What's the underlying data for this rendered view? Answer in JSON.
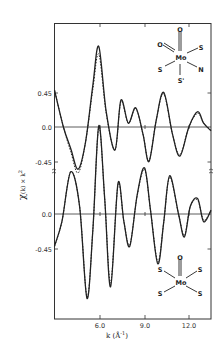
{
  "chart_data": {
    "type": "line",
    "title": "",
    "xlabel": "k (Å⁻¹)",
    "ylabel": "χ(k) × k²",
    "xlim": [
      2.9,
      13.5
    ],
    "x_ticks": [
      6.0,
      9.0,
      12.0
    ],
    "x_tick_labels": [
      "6.0",
      "9.0",
      "12.0"
    ],
    "grid": false,
    "legend": null,
    "panels": [
      {
        "name": "top",
        "structure_label": {
          "center": "Mo",
          "ligands": [
            "O",
            "O",
            "S",
            "S",
            "N",
            "S'"
          ]
        },
        "y_ticks": [
          0.45,
          0.0,
          -0.45
        ],
        "y_tick_labels": [
          "0.45",
          "0.0",
          "-0.45"
        ],
        "series": [
          {
            "name": "experimental",
            "style": "solid",
            "x": [
              2.9,
              3.5,
              4.0,
              4.5,
              5.0,
              5.5,
              5.9,
              6.4,
              7.0,
              7.4,
              7.9,
              8.4,
              8.9,
              9.3,
              9.8,
              10.3,
              10.9,
              11.4,
              12.0,
              12.6,
              13.0,
              13.5
            ],
            "y": [
              0.48,
              0.0,
              -0.28,
              -0.55,
              -0.2,
              0.55,
              1.05,
              0.2,
              -0.3,
              0.35,
              0.05,
              0.25,
              -0.1,
              -0.45,
              0.1,
              0.45,
              -0.1,
              -0.38,
              0.0,
              0.2,
              0.05,
              -0.05
            ]
          },
          {
            "name": "fit",
            "style": "dashed",
            "x": [
              2.9,
              3.5,
              4.0,
              4.5,
              5.0,
              5.5,
              5.9,
              6.4,
              7.0,
              7.4,
              7.9,
              8.4,
              8.9,
              9.3,
              9.8,
              10.3,
              10.9,
              11.4,
              12.0,
              12.6,
              13.0,
              13.5
            ],
            "y": [
              0.48,
              0.0,
              -0.32,
              -0.6,
              -0.2,
              0.5,
              0.95,
              0.18,
              -0.3,
              0.33,
              0.05,
              0.24,
              -0.1,
              -0.44,
              0.1,
              0.43,
              -0.1,
              -0.36,
              0.0,
              0.18,
              0.05,
              -0.04
            ]
          }
        ]
      },
      {
        "name": "bottom",
        "structure_label": {
          "center": "Mo",
          "ligands": [
            "O",
            "S",
            "S",
            "S",
            "S"
          ]
        },
        "y_ticks": [
          0.0,
          -0.45
        ],
        "y_tick_labels": [
          "0.0",
          "-0.45"
        ],
        "series": [
          {
            "name": "experimental",
            "style": "solid",
            "x": [
              2.9,
              3.4,
              4.0,
              4.6,
              5.1,
              5.5,
              5.9,
              6.3,
              6.7,
              7.2,
              7.6,
              8.0,
              8.5,
              9.0,
              9.4,
              9.9,
              10.3,
              10.7,
              11.3,
              11.7,
              12.1,
              12.6,
              13.0,
              13.5
            ],
            "y": [
              -0.42,
              -0.1,
              0.55,
              0.1,
              -1.1,
              -0.2,
              1.15,
              0.2,
              -0.95,
              0.4,
              -0.1,
              -0.42,
              0.25,
              0.6,
              0.05,
              -0.65,
              -0.1,
              0.5,
              0.0,
              -0.3,
              0.1,
              0.2,
              -0.1,
              0.05
            ]
          },
          {
            "name": "fit",
            "style": "dashed",
            "x": [
              2.9,
              3.4,
              4.0,
              4.6,
              5.1,
              5.5,
              5.9,
              6.3,
              6.7,
              7.2,
              7.6,
              8.0,
              8.5,
              9.0,
              9.4,
              9.9,
              10.3,
              10.7,
              11.3,
              11.7,
              12.1,
              12.6,
              13.0,
              13.5
            ],
            "y": [
              -0.42,
              -0.1,
              0.55,
              0.1,
              -1.08,
              -0.2,
              1.13,
              0.2,
              -0.9,
              0.38,
              -0.1,
              -0.4,
              0.24,
              0.58,
              0.05,
              -0.62,
              -0.1,
              0.48,
              0.0,
              -0.28,
              0.1,
              0.18,
              -0.08,
              0.04
            ]
          }
        ]
      }
    ]
  },
  "labels": {
    "top_y_0": "0.45",
    "top_y_1": "0.0",
    "top_y_2": "-0.45",
    "bot_y_0": "0.0",
    "bot_y_1": "-0.45",
    "x_0": "6.0",
    "x_1": "9.0",
    "x_2": "12.0",
    "xlabel_k": "k (Å",
    "xlabel_exp": "-1",
    "xlabel_close": ")",
    "ylabel_chi": "χ",
    "ylabel_rest": "(k) × k",
    "ylabel_exp": "2",
    "mol_top": {
      "o_top": "O",
      "o_left": "O",
      "s_ur": "S",
      "mo": "Mo",
      "s_l": "S",
      "n": "N",
      "s_prime": "S'"
    },
    "mol_bot": {
      "o_top": "O",
      "s_ul": "S",
      "s_ur": "S",
      "mo": "Mo",
      "s_ll": "S",
      "s_lr": "S"
    }
  }
}
